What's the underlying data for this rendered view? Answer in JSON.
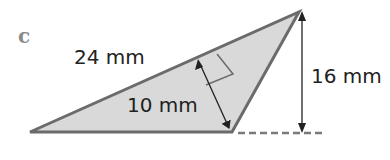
{
  "figure": {
    "part_label": "c",
    "shape": "obtuse triangle with altitude drawn to the 24 mm side and external height",
    "labels": {
      "hypotenuse": "24 mm",
      "altitude": "10 mm",
      "height": "16 mm"
    },
    "colors": {
      "fill": "#d9d9d9",
      "stroke": "#6b6b6b",
      "arrow": "#222222",
      "dash": "#7a7a7a",
      "part_label": "#8a8a8a"
    }
  }
}
